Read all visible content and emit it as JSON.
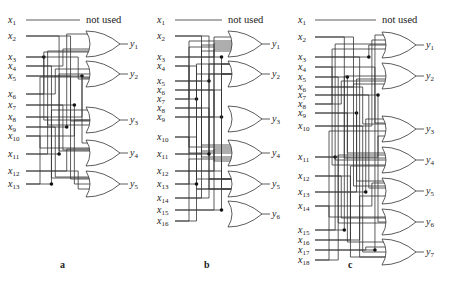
{
  "figure": {
    "panels": [
      {
        "id": "a",
        "caption": "a",
        "unused_note": "not used",
        "inputs": [
          "x1",
          "x2",
          "x3",
          "x4",
          "x5",
          "x6",
          "x7",
          "x8",
          "x9",
          "x10",
          "x11",
          "x12",
          "x13"
        ],
        "outputs": [
          "y1",
          "y2",
          "y3",
          "y4",
          "y5"
        ],
        "gate_type": "OR",
        "gate_count": 5
      },
      {
        "id": "b",
        "caption": "b",
        "unused_note": "not used",
        "inputs": [
          "x1",
          "x2",
          "x3",
          "x4",
          "x5",
          "x6",
          "x7",
          "x8",
          "x9",
          "x10",
          "x11",
          "x12",
          "x13",
          "x14",
          "x15",
          "x16"
        ],
        "outputs": [
          "y1",
          "y2",
          "y3",
          "y4",
          "y5",
          "y6"
        ],
        "gate_type": "OR",
        "gate_count": 6
      },
      {
        "id": "c",
        "caption": "c",
        "unused_note": "not used",
        "inputs": [
          "x1",
          "x2",
          "x3",
          "x4",
          "x5",
          "x6",
          "x7",
          "x8",
          "x9",
          "x10",
          "x11",
          "x12",
          "x13",
          "x14",
          "x15",
          "x16",
          "x17",
          "x18"
        ],
        "outputs": [
          "y1",
          "y2",
          "y3",
          "y4",
          "y5",
          "y6",
          "y7"
        ],
        "gate_type": "OR",
        "gate_count": 7
      }
    ],
    "layout": {
      "a": {
        "label_x": 8,
        "wire_start": 26,
        "gate_x": 86,
        "rows": [
          20,
          36,
          57,
          66,
          76,
          94,
          105,
          117,
          127,
          136,
          154,
          171,
          184
        ],
        "gates": [
          44,
          74,
          120,
          153,
          184
        ],
        "caption_pos": [
          60,
          268
        ]
      },
      "b": {
        "label_x": 157,
        "wire_start": 175,
        "gate_x": 228,
        "rows": [
          20,
          36,
          57,
          66,
          81,
          90,
          99,
          108,
          117,
          137,
          154,
          171,
          184,
          198,
          210,
          221
        ],
        "gates": [
          44,
          74,
          119,
          153,
          184,
          214
        ],
        "caption_pos": [
          204,
          268
        ]
      },
      "c": {
        "label_x": 298,
        "wire_start": 315,
        "gate_x": 382,
        "rows": [
          20,
          37,
          57,
          67,
          77,
          87,
          95,
          104,
          113,
          126,
          157,
          176,
          192,
          206,
          230,
          240,
          250,
          260
        ],
        "gates": [
          45,
          76,
          129,
          160,
          191,
          222,
          252
        ],
        "caption_pos": [
          348,
          268
        ]
      }
    }
  }
}
